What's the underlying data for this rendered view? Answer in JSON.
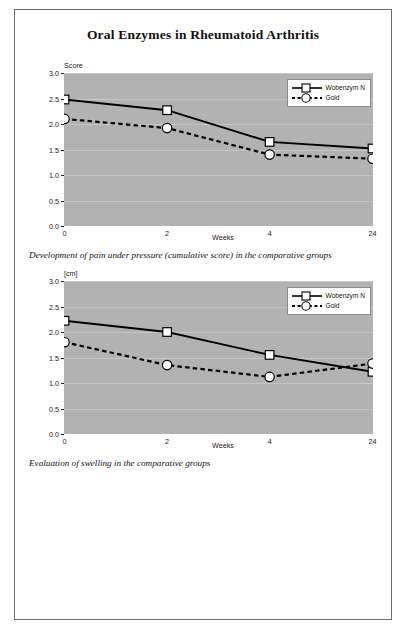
{
  "document": {
    "title": "Oral Enzymes in Rheumatoid Arthritis"
  },
  "figures": [
    {
      "name": "pain-under-pressure",
      "caption": "Development of pain under pressure (cumulative score) in the comparative groups",
      "y_axis_title": "Score",
      "x_axis_title": "Weeks"
    },
    {
      "name": "swelling",
      "caption": "Evaluation of swelling in the comparative groups",
      "y_axis_title": "[cm]",
      "x_axis_title": "Weeks"
    }
  ],
  "legend": {
    "wobenzym": "Wobenzym N",
    "gold": "Gold"
  },
  "colors": {
    "plot_background": "#b2b2b2",
    "gridline": "#c6c6c6",
    "line": "#000000",
    "marker_fill": "#ffffff",
    "page_border": "#6f6f6f"
  },
  "chart_data": [
    {
      "type": "line",
      "title": "Development of pain under pressure (cumulative score) in the comparative groups",
      "xlabel": "Weeks",
      "ylabel": "Score",
      "categories": [
        "0",
        "2",
        "4",
        "24"
      ],
      "x_tick_labels": [
        "0",
        "2",
        "4",
        "24"
      ],
      "y_tick_labels": [
        "0.0",
        "0.5",
        "1.0",
        "1.5",
        "2.0",
        "2.5",
        "3.0"
      ],
      "ylim": [
        0.0,
        3.0
      ],
      "grid": true,
      "legend_position": "top-right",
      "series": [
        {
          "name": "Wobenzym N",
          "marker": "square",
          "line_style": "solid",
          "values": [
            2.48,
            2.27,
            1.65,
            1.52
          ]
        },
        {
          "name": "Gold",
          "marker": "circle",
          "line_style": "dashed",
          "values": [
            2.1,
            1.92,
            1.4,
            1.32
          ]
        }
      ]
    },
    {
      "type": "line",
      "title": "Evaluation of swelling in the comparative groups",
      "xlabel": "Weeks",
      "ylabel": "[cm]",
      "categories": [
        "0",
        "2",
        "4",
        "24"
      ],
      "x_tick_labels": [
        "0",
        "2",
        "4",
        "24"
      ],
      "y_tick_labels": [
        "0.0",
        "0.5",
        "1.0",
        "1.5",
        "2.0",
        "2.5",
        "3.0"
      ],
      "ylim": [
        0.0,
        3.0
      ],
      "grid": true,
      "legend_position": "top-right",
      "series": [
        {
          "name": "Wobenzym N",
          "marker": "square",
          "line_style": "solid",
          "values": [
            2.22,
            2.0,
            1.55,
            1.22
          ]
        },
        {
          "name": "Gold",
          "marker": "circle",
          "line_style": "dashed",
          "values": [
            1.8,
            1.35,
            1.12,
            1.38
          ]
        }
      ]
    }
  ]
}
